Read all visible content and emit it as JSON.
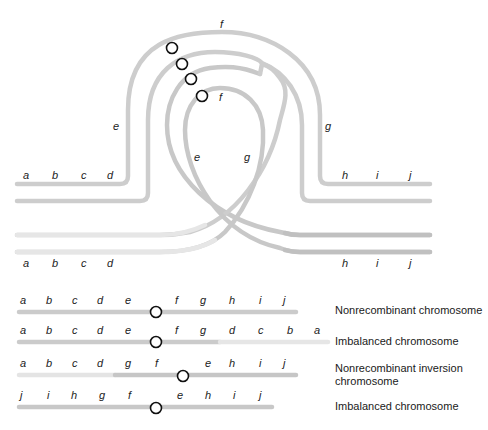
{
  "colors": {
    "segment_dark": "#c4c4c4",
    "segment_mid": "#cfcfcf",
    "segment_light": "#e4e4e4",
    "centromere_stroke": "#111111",
    "text": "#222222"
  },
  "top_diagram": {
    "loop_labels": {
      "outer_f": "f",
      "inner_f": "f",
      "outer_e": "e",
      "outer_g": "g",
      "inner_e": "e",
      "inner_g": "g"
    },
    "upper_left_genes": [
      "a",
      "b",
      "c",
      "d"
    ],
    "upper_right_genes": [
      "h",
      "i",
      "j"
    ],
    "lower_left_genes": [
      "a",
      "b",
      "c",
      "d"
    ],
    "lower_right_genes": [
      "h",
      "i",
      "j"
    ]
  },
  "products": [
    {
      "genes": [
        "a",
        "b",
        "c",
        "d",
        "e",
        "f",
        "g",
        "h",
        "i",
        "j"
      ],
      "caption_lines": [
        "Nonrecombinant chromosome"
      ]
    },
    {
      "genes": [
        "a",
        "b",
        "c",
        "d",
        "e",
        "f",
        "g",
        "d",
        "c",
        "b",
        "a"
      ],
      "caption_lines": [
        "Imbalanced chromosome"
      ]
    },
    {
      "genes": [
        "a",
        "b",
        "c",
        "d",
        "g",
        "f",
        "e",
        "h",
        "i",
        "j"
      ],
      "caption_lines": [
        "Nonrecombinant inversion",
        "chromosome"
      ]
    },
    {
      "genes": [
        "j",
        "i",
        "h",
        "g",
        "f",
        "e",
        "h",
        "i",
        "j"
      ],
      "caption_lines": [
        "Imbalanced chromosome"
      ]
    }
  ]
}
